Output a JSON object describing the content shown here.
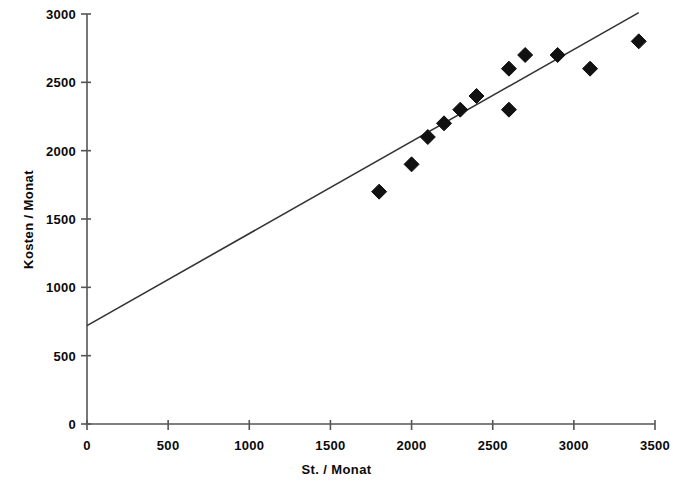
{
  "chart_data": {
    "type": "scatter",
    "title": "",
    "xlabel": "St. / Monat",
    "ylabel": "Kosten / Monat",
    "xlim": [
      0,
      3500
    ],
    "ylim": [
      0,
      3000
    ],
    "xticks": [
      0,
      500,
      1000,
      1500,
      2000,
      2500,
      3000,
      3500
    ],
    "yticks": [
      0,
      500,
      1000,
      1500,
      2000,
      2500,
      3000
    ],
    "xtick_labels": [
      "0",
      "500",
      "1000",
      "1500",
      "2000",
      "2500",
      "3000",
      "3500"
    ],
    "ytick_labels": [
      "0",
      "500",
      "1000",
      "1500",
      "2000",
      "2500",
      "3000"
    ],
    "grid": false,
    "legend": false,
    "marker": "diamond",
    "marker_color": "#111111",
    "line_color": "#333333",
    "axis_color": "#555555",
    "background": "#ffffff",
    "series": [
      {
        "name": "Kosten je Stunden",
        "type": "scatter",
        "points": [
          {
            "x": 1800,
            "y": 1700
          },
          {
            "x": 2000,
            "y": 1900
          },
          {
            "x": 2100,
            "y": 2100
          },
          {
            "x": 2200,
            "y": 2200
          },
          {
            "x": 2300,
            "y": 2300
          },
          {
            "x": 2400,
            "y": 2400
          },
          {
            "x": 2600,
            "y": 2300
          },
          {
            "x": 2600,
            "y": 2600
          },
          {
            "x": 2700,
            "y": 2700
          },
          {
            "x": 2900,
            "y": 2700
          },
          {
            "x": 3100,
            "y": 2600
          },
          {
            "x": 3400,
            "y": 2800
          }
        ]
      },
      {
        "name": "Trendlinie",
        "type": "line",
        "points": [
          {
            "x": 0,
            "y": 720
          },
          {
            "x": 3400,
            "y": 3010
          }
        ]
      }
    ]
  }
}
